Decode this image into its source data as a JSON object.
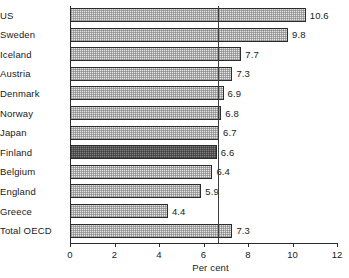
{
  "chart_data": {
    "type": "bar",
    "orientation": "horizontal",
    "title": "",
    "xlabel": "Per cent",
    "ylabel": "",
    "xlim": [
      0,
      12
    ],
    "xticks": [
      0,
      2,
      4,
      6,
      8,
      10,
      12
    ],
    "xtick_labels": [
      "0",
      "2",
      "4",
      "6",
      "8",
      "10",
      "12"
    ],
    "grid": false,
    "legend": null,
    "categories": [
      "US",
      "Sweden",
      "Iceland",
      "Austria",
      "Denmark",
      "Norway",
      "Japan",
      "Finland",
      "Belgium",
      "England",
      "Greece",
      "Total OECD"
    ],
    "values": [
      10.6,
      9.8,
      7.7,
      7.3,
      6.9,
      6.8,
      6.7,
      6.6,
      6.4,
      5.9,
      4.4,
      7.3
    ],
    "value_labels": [
      "10.6",
      "9.8",
      "7.7",
      "7.3",
      "6.9",
      "6.8",
      "6.7",
      "6.6",
      "6.4",
      "5.9",
      "4.4",
      "7.3"
    ],
    "highlighted_category": "Finland",
    "reference_line": {
      "value": 6.65,
      "orientation": "vertical"
    },
    "colors": {
      "bar_fill": "#e4e4e4",
      "bar_highlight_fill": "#7e7e7e",
      "bar_border": "#2b2b2b",
      "axis": "#2b2b2b",
      "text": "#1a1a1a",
      "reference_line": "#3c3c3c"
    }
  }
}
